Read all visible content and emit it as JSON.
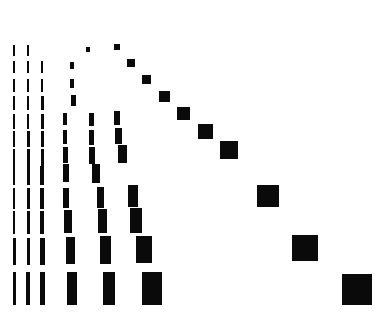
{
  "figure": {
    "width": 382,
    "height": 316,
    "background_color": "#ffffff",
    "mark_color": "#0a0a0a",
    "title": "",
    "has_axes": false,
    "has_gridlines": false,
    "has_legend": false,
    "has_tick_labels": false
  },
  "chart_data": {
    "type": "heatmap",
    "subtype": "hinton-diagram",
    "title": "",
    "subtitle": "",
    "xlabel": "",
    "ylabel": "",
    "grid": false,
    "legend": false,
    "legend_position": "none",
    "rows": 12,
    "cols": 12,
    "x": [
      1,
      2,
      3,
      4,
      5,
      6,
      7,
      8,
      9,
      10,
      11,
      12
    ],
    "y": [
      1,
      2,
      3,
      4,
      5,
      6,
      7,
      8,
      9,
      10,
      11,
      12
    ],
    "xticklabels": [],
    "yticklabels": [],
    "xlim": [
      0,
      382
    ],
    "ylim": [
      0,
      316
    ],
    "col_centers_px": [
      14,
      28,
      42,
      70,
      88,
      113,
      132,
      155,
      180,
      211,
      248,
      288
    ],
    "row_centers_px": [
      50,
      67,
      85,
      103,
      121,
      139,
      157,
      175,
      198,
      222,
      251,
      288
    ],
    "cells": [
      {
        "row": 1,
        "col": 1,
        "cx": 14,
        "cy": 50,
        "w": 2,
        "h": 11
      },
      {
        "row": 1,
        "col": 2,
        "cx": 28,
        "cy": 50,
        "w": 2,
        "h": 11
      },
      {
        "row": 1,
        "col": 5,
        "cx": 88,
        "cy": 49,
        "w": 4,
        "h": 5
      },
      {
        "row": 1,
        "col": 8,
        "cx": 117,
        "cy": 47,
        "w": 6,
        "h": 6
      },
      {
        "row": 2,
        "col": 1,
        "cx": 14,
        "cy": 67,
        "w": 2,
        "h": 12
      },
      {
        "row": 2,
        "col": 2,
        "cx": 28,
        "cy": 67,
        "w": 2,
        "h": 12
      },
      {
        "row": 2,
        "col": 3,
        "cx": 42,
        "cy": 67,
        "w": 2,
        "h": 12
      },
      {
        "row": 2,
        "col": 5,
        "cx": 72,
        "cy": 65,
        "w": 4,
        "h": 7
      },
      {
        "row": 2,
        "col": 9,
        "cx": 131,
        "cy": 63,
        "w": 8,
        "h": 8
      },
      {
        "row": 3,
        "col": 1,
        "cx": 14,
        "cy": 85,
        "w": 2,
        "h": 13
      },
      {
        "row": 3,
        "col": 2,
        "cx": 28,
        "cy": 85,
        "w": 2,
        "h": 13
      },
      {
        "row": 3,
        "col": 3,
        "cx": 42,
        "cy": 85,
        "w": 2,
        "h": 13
      },
      {
        "row": 3,
        "col": 5,
        "cx": 72,
        "cy": 83,
        "w": 4,
        "h": 9
      },
      {
        "row": 3,
        "col": 10,
        "cx": 146,
        "cy": 79,
        "w": 9,
        "h": 9
      },
      {
        "row": 4,
        "col": 1,
        "cx": 14,
        "cy": 103,
        "w": 2,
        "h": 14
      },
      {
        "row": 4,
        "col": 2,
        "cx": 28,
        "cy": 103,
        "w": 2,
        "h": 14
      },
      {
        "row": 4,
        "col": 3,
        "cx": 42,
        "cy": 103,
        "w": 3,
        "h": 14
      },
      {
        "row": 4,
        "col": 5,
        "cx": 73,
        "cy": 100,
        "w": 5,
        "h": 11
      },
      {
        "row": 4,
        "col": 11,
        "cx": 164,
        "cy": 96,
        "w": 11,
        "h": 11
      },
      {
        "row": 5,
        "col": 1,
        "cx": 14,
        "cy": 121,
        "w": 2,
        "h": 15
      },
      {
        "row": 5,
        "col": 2,
        "cx": 28,
        "cy": 121,
        "w": 2,
        "h": 15
      },
      {
        "row": 5,
        "col": 3,
        "cx": 42,
        "cy": 121,
        "w": 3,
        "h": 15
      },
      {
        "row": 5,
        "col": 4,
        "cx": 65,
        "cy": 119,
        "w": 4,
        "h": 12
      },
      {
        "row": 5,
        "col": 6,
        "cx": 91,
        "cy": 119,
        "w": 5,
        "h": 13
      },
      {
        "row": 5,
        "col": 7,
        "cx": 117,
        "cy": 118,
        "w": 6,
        "h": 14
      },
      {
        "row": 5,
        "col": 12,
        "cx": 183,
        "cy": 113,
        "w": 13,
        "h": 13
      },
      {
        "row": 6,
        "col": 1,
        "cx": 14,
        "cy": 139,
        "w": 2,
        "h": 16
      },
      {
        "row": 6,
        "col": 2,
        "cx": 28,
        "cy": 139,
        "w": 3,
        "h": 16
      },
      {
        "row": 6,
        "col": 3,
        "cx": 42,
        "cy": 139,
        "w": 3,
        "h": 16
      },
      {
        "row": 6,
        "col": 4,
        "cx": 65,
        "cy": 137,
        "w": 4,
        "h": 14
      },
      {
        "row": 6,
        "col": 6,
        "cx": 91,
        "cy": 137,
        "w": 5,
        "h": 15
      },
      {
        "row": 6,
        "col": 7,
        "cx": 118,
        "cy": 136,
        "w": 7,
        "h": 16
      },
      {
        "row": 6,
        "col": 12,
        "cx": 205,
        "cy": 131,
        "w": 15,
        "h": 15
      },
      {
        "row": 7,
        "col": 1,
        "cx": 14,
        "cy": 157,
        "w": 2,
        "h": 17
      },
      {
        "row": 7,
        "col": 2,
        "cx": 28,
        "cy": 157,
        "w": 3,
        "h": 17
      },
      {
        "row": 7,
        "col": 3,
        "cx": 42,
        "cy": 157,
        "w": 3,
        "h": 17
      },
      {
        "row": 7,
        "col": 4,
        "cx": 65,
        "cy": 155,
        "w": 5,
        "h": 16
      },
      {
        "row": 7,
        "col": 6,
        "cx": 92,
        "cy": 155,
        "w": 6,
        "h": 17
      },
      {
        "row": 7,
        "col": 7,
        "cx": 122,
        "cy": 154,
        "w": 9,
        "h": 18
      },
      {
        "row": 7,
        "col": 12,
        "cx": 229,
        "cy": 150,
        "w": 18,
        "h": 18
      },
      {
        "row": 8,
        "col": 1,
        "cx": 14,
        "cy": 175,
        "w": 2,
        "h": 19
      },
      {
        "row": 8,
        "col": 2,
        "cx": 28,
        "cy": 175,
        "w": 3,
        "h": 19
      },
      {
        "row": 8,
        "col": 3,
        "cx": 42,
        "cy": 175,
        "w": 4,
        "h": 19
      },
      {
        "row": 8,
        "col": 4,
        "cx": 66,
        "cy": 173,
        "w": 6,
        "h": 18
      },
      {
        "row": 8,
        "col": 6,
        "cx": 96,
        "cy": 173,
        "w": 8,
        "h": 19
      },
      {
        "row": 9,
        "col": 1,
        "cx": 14,
        "cy": 198,
        "w": 2,
        "h": 21
      },
      {
        "row": 9,
        "col": 2,
        "cx": 28,
        "cy": 198,
        "w": 3,
        "h": 21
      },
      {
        "row": 9,
        "col": 3,
        "cx": 42,
        "cy": 198,
        "w": 4,
        "h": 21
      },
      {
        "row": 9,
        "col": 4,
        "cx": 66,
        "cy": 198,
        "w": 6,
        "h": 20
      },
      {
        "row": 9,
        "col": 5,
        "cx": 100,
        "cy": 197,
        "w": 7,
        "h": 21
      },
      {
        "row": 9,
        "col": 6,
        "cx": 133,
        "cy": 196,
        "w": 10,
        "h": 22
      },
      {
        "row": 9,
        "col": 12,
        "cx": 268,
        "cy": 196,
        "w": 22,
        "h": 22
      },
      {
        "row": 10,
        "col": 1,
        "cx": 14,
        "cy": 222,
        "w": 2,
        "h": 23
      },
      {
        "row": 10,
        "col": 2,
        "cx": 28,
        "cy": 222,
        "w": 3,
        "h": 23
      },
      {
        "row": 10,
        "col": 3,
        "cx": 42,
        "cy": 222,
        "w": 4,
        "h": 23
      },
      {
        "row": 10,
        "col": 4,
        "cx": 68,
        "cy": 221,
        "w": 8,
        "h": 23
      },
      {
        "row": 10,
        "col": 5,
        "cx": 102,
        "cy": 221,
        "w": 9,
        "h": 24
      },
      {
        "row": 10,
        "col": 6,
        "cx": 136,
        "cy": 220,
        "w": 12,
        "h": 25
      },
      {
        "row": 11,
        "col": 1,
        "cx": 14,
        "cy": 251,
        "w": 3,
        "h": 27
      },
      {
        "row": 11,
        "col": 2,
        "cx": 28,
        "cy": 251,
        "w": 3,
        "h": 27
      },
      {
        "row": 11,
        "col": 3,
        "cx": 42,
        "cy": 251,
        "w": 5,
        "h": 27
      },
      {
        "row": 11,
        "col": 4,
        "cx": 70,
        "cy": 250,
        "w": 9,
        "h": 27
      },
      {
        "row": 11,
        "col": 5,
        "cx": 105,
        "cy": 250,
        "w": 11,
        "h": 28
      },
      {
        "row": 11,
        "col": 6,
        "cx": 144,
        "cy": 249,
        "w": 16,
        "h": 27
      },
      {
        "row": 11,
        "col": 12,
        "cx": 305,
        "cy": 248,
        "w": 26,
        "h": 26
      },
      {
        "row": 12,
        "col": 1,
        "cx": 14,
        "cy": 288,
        "w": 3,
        "h": 33
      },
      {
        "row": 12,
        "col": 2,
        "cx": 28,
        "cy": 288,
        "w": 4,
        "h": 33
      },
      {
        "row": 12,
        "col": 3,
        "cx": 42,
        "cy": 288,
        "w": 5,
        "h": 33
      },
      {
        "row": 12,
        "col": 4,
        "cx": 72,
        "cy": 288,
        "w": 10,
        "h": 33
      },
      {
        "row": 12,
        "col": 5,
        "cx": 109,
        "cy": 288,
        "w": 12,
        "h": 33
      },
      {
        "row": 12,
        "col": 6,
        "cx": 152,
        "cy": 288,
        "w": 20,
        "h": 33
      },
      {
        "row": 12,
        "col": 12,
        "cx": 357,
        "cy": 289,
        "w": 30,
        "h": 31
      }
    ]
  }
}
